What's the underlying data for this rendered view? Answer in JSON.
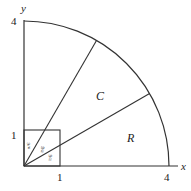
{
  "diagram": {
    "axes": {
      "x_label": "x",
      "y_label": "y"
    },
    "ticks": {
      "x_one": "1",
      "x_four": "4",
      "y_one": "1",
      "y_four": "4"
    },
    "regions": {
      "c_label": "C",
      "r_label": "R"
    },
    "angles": [
      "π/6",
      "π/6",
      "π/6"
    ],
    "angle_parts": {
      "num": "π",
      "den": "6"
    },
    "geometry": {
      "quarter_circle_radius": 4,
      "square_side": 1,
      "ray_angles_deg": [
        30,
        60
      ]
    },
    "colors": {
      "stroke": "#333333",
      "background": "#ffffff"
    }
  }
}
